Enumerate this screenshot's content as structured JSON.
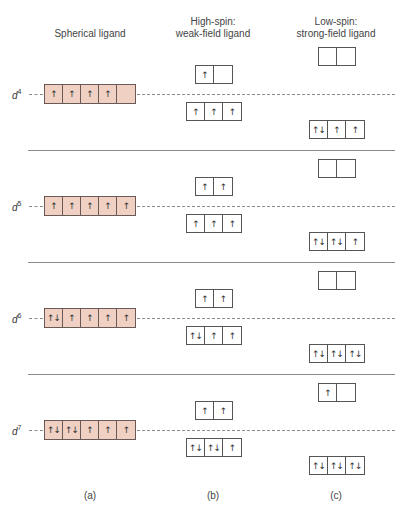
{
  "headers": {
    "a": "Spherical ligand",
    "b_line1": "High-spin:",
    "b_line2": "weak-field ligand",
    "c_line1": "Low-spin:",
    "c_line2": "strong-field ligand"
  },
  "captions": {
    "a": "(a)",
    "b": "(b)",
    "c": "(c)"
  },
  "colors": {
    "spherical_fill": "#f0d0c3",
    "box_border": "#555555",
    "separator": "#8a8a8a"
  },
  "arrow_legend": {
    "up": "↑",
    "pair": "↑↓",
    "empty": ""
  },
  "rows": [
    {
      "label": "d",
      "electrons": "4",
      "spherical": [
        "↑",
        "↑",
        "↑",
        "↑",
        ""
      ],
      "high_spin_eg": [
        "↑",
        ""
      ],
      "high_spin_t2g": [
        "↑",
        "↑",
        "↑"
      ],
      "low_spin_eg": [
        "",
        ""
      ],
      "low_spin_t2g": [
        "↑↓",
        "↑",
        "↑"
      ]
    },
    {
      "label": "d",
      "electrons": "5",
      "spherical": [
        "↑",
        "↑",
        "↑",
        "↑",
        "↑"
      ],
      "high_spin_eg": [
        "↑",
        "↑"
      ],
      "high_spin_t2g": [
        "↑",
        "↑",
        "↑"
      ],
      "low_spin_eg": [
        "",
        ""
      ],
      "low_spin_t2g": [
        "↑↓",
        "↑↓",
        "↑"
      ]
    },
    {
      "label": "d",
      "electrons": "6",
      "spherical": [
        "↑↓",
        "↑",
        "↑",
        "↑",
        "↑"
      ],
      "high_spin_eg": [
        "↑",
        "↑"
      ],
      "high_spin_t2g": [
        "↑↓",
        "↑",
        "↑"
      ],
      "low_spin_eg": [
        "",
        ""
      ],
      "low_spin_t2g": [
        "↑↓",
        "↑↓",
        "↑↓"
      ]
    },
    {
      "label": "d",
      "electrons": "7",
      "spherical": [
        "↑↓",
        "↑↓",
        "↑",
        "↑",
        "↑"
      ],
      "high_spin_eg": [
        "↑",
        "↑"
      ],
      "high_spin_t2g": [
        "↑↓",
        "↑↓",
        "↑"
      ],
      "low_spin_eg": [
        "↑",
        ""
      ],
      "low_spin_t2g": [
        "↑↓",
        "↑↓",
        "↑↓"
      ]
    }
  ]
}
